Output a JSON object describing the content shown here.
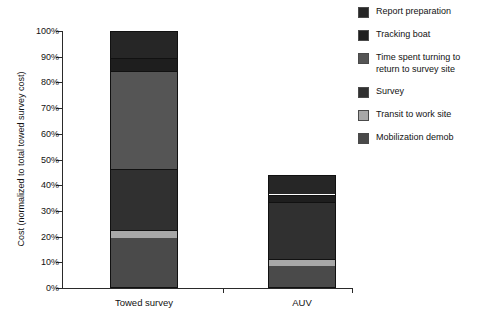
{
  "chart_data": {
    "type": "bar",
    "subtype": "stacked-bar",
    "title": "",
    "xlabel": "",
    "ylabel": "Cost (normalized to total towed survey cost)",
    "categories": [
      "Towed survey",
      "AUV"
    ],
    "ylim": [
      0,
      100
    ],
    "ytick_labels": [
      "0%",
      "10%",
      "20%",
      "30%",
      "40%",
      "50%",
      "60%",
      "70%",
      "80%",
      "90%",
      "100%"
    ],
    "ytick_values": [
      0,
      10,
      20,
      30,
      40,
      50,
      60,
      70,
      80,
      90,
      100
    ],
    "yunit": "%",
    "grid": false,
    "legend_position": "right",
    "series": [
      {
        "name": "Mobilization demob",
        "color": "#4a4a4a",
        "values": [
          19,
          8
        ]
      },
      {
        "name": "Transit to work site",
        "color": "#a8a8a8",
        "values": [
          3,
          3
        ]
      },
      {
        "name": "Survey",
        "color": "#303030",
        "values": [
          24,
          22
        ]
      },
      {
        "name": "Time spent turning to\nreturn to survey site",
        "color": "#555555",
        "values": [
          38,
          0
        ]
      },
      {
        "name": "Tracking boat",
        "color": "#1e1e1e",
        "values": [
          5,
          3
        ]
      },
      {
        "name": "Report preparation",
        "color": "#262626",
        "values": [
          11,
          8
        ]
      }
    ],
    "totals": [
      100,
      44
    ],
    "legend_order": [
      "Report preparation",
      "Tracking boat",
      "Time spent turning to\nreturn to survey site",
      "Survey",
      "Transit to work site",
      "Mobilization demob"
    ]
  },
  "legend": {
    "items": [
      {
        "label": "Report preparation",
        "color": "#262626",
        "swatch_name": "legend-swatch-report-preparation"
      },
      {
        "label": "Tracking boat",
        "color": "#1e1e1e",
        "swatch_name": "legend-swatch-tracking-boat"
      },
      {
        "label": "Time spent turning to\nreturn to survey site",
        "color": "#555555",
        "swatch_name": "legend-swatch-time-spent-turning"
      },
      {
        "label": "Survey",
        "color": "#303030",
        "swatch_name": "legend-swatch-survey"
      },
      {
        "label": "Transit to work site",
        "color": "#a8a8a8",
        "swatch_name": "legend-swatch-transit-to-work-site"
      },
      {
        "label": "Mobilization demob",
        "color": "#4a4a4a",
        "swatch_name": "legend-swatch-mobilization-demob"
      }
    ]
  },
  "axes": {
    "y_title": "Cost (normalized to total towed survey cost)",
    "y_ticks": [
      "100%",
      "90%",
      "80%",
      "70%",
      "60%",
      "50%",
      "40%",
      "30%",
      "20%",
      "10%",
      "0%"
    ],
    "x_ticks": [
      "Towed survey",
      "AUV"
    ]
  },
  "colors": {
    "axis": "#2a2a2a",
    "bar_outline": "#111111",
    "background": "#ffffff",
    "text": "#121212"
  }
}
